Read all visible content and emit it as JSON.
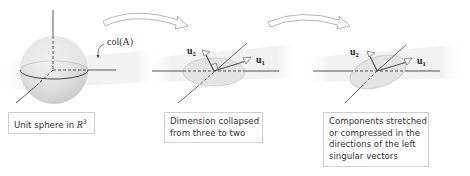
{
  "panels": [
    {
      "id": "sphere",
      "caption_text": "Unit sphere in R",
      "caption_parts": {
        "prefix": "Unit sphere in ",
        "space": "R",
        "exponent": "3"
      },
      "label": "col(A)"
    },
    {
      "id": "collapsed",
      "caption_lines": [
        "Dimension collapsed",
        "from three to two"
      ],
      "vectors": [
        {
          "name": "u",
          "sub": "2"
        },
        {
          "name": "u",
          "sub": "1"
        }
      ]
    },
    {
      "id": "stretched",
      "caption_lines": [
        "Components stretched",
        "or compressed in the",
        "directions of the left",
        "singular vectors"
      ],
      "vectors": [
        {
          "name": "u",
          "sub": "2"
        },
        {
          "name": "u",
          "sub": "1"
        }
      ]
    }
  ],
  "transitions": [
    {
      "from": "sphere",
      "to": "collapsed",
      "icon": "curved-arrow-icon"
    },
    {
      "from": "collapsed",
      "to": "stretched",
      "icon": "curved-arrow-icon"
    }
  ],
  "colors": {
    "sphere_fill": "#dcdcdc",
    "plane_fill": "#f2f2f2",
    "ellipse_fill": "#e3e3e3",
    "axis_line": "#444444",
    "caption_border": "#cfcfcf"
  }
}
